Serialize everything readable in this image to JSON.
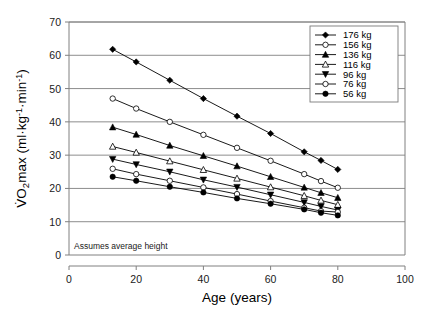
{
  "chart_data": {
    "type": "line",
    "title": "",
    "xlabel": "Age (years)",
    "ylabel": "VO2max (ml·kg⁻¹·min⁻¹)",
    "xlim": [
      0,
      100
    ],
    "ylim": [
      0,
      70
    ],
    "xticks": [
      0,
      20,
      40,
      60,
      80,
      100
    ],
    "yticks": [
      0,
      10,
      20,
      30,
      40,
      50,
      60,
      70
    ],
    "grid": "horizontal",
    "legend_position": "top-right",
    "annotation": "Assumes average height",
    "x": [
      13,
      20,
      30,
      40,
      50,
      60,
      70,
      75,
      80
    ],
    "series": [
      {
        "name": "176 kg",
        "marker": "filled-diamond",
        "values": [
          61.8,
          58.0,
          52.5,
          47.0,
          41.7,
          36.5,
          31.0,
          28.4,
          25.7
        ]
      },
      {
        "name": "156 kg",
        "marker": "open-circle",
        "values": [
          47.0,
          44.0,
          40.0,
          36.1,
          32.2,
          28.3,
          24.3,
          22.2,
          20.2
        ]
      },
      {
        "name": "136 kg",
        "marker": "filled-triangle",
        "values": [
          38.4,
          36.2,
          32.9,
          29.8,
          26.7,
          23.5,
          20.3,
          18.7,
          17.2
        ]
      },
      {
        "name": "116 kg",
        "marker": "open-triangle",
        "values": [
          32.6,
          30.8,
          28.2,
          25.6,
          23.0,
          20.4,
          17.8,
          16.4,
          15.1
        ]
      },
      {
        "name": "96 kg",
        "marker": "filled-down-triangle",
        "values": [
          28.8,
          27.2,
          25.0,
          22.6,
          20.4,
          18.1,
          15.8,
          14.6,
          13.5
        ]
      },
      {
        "name": "76 kg",
        "marker": "open-circle",
        "values": [
          25.9,
          24.3,
          22.3,
          20.3,
          18.3,
          16.2,
          14.2,
          13.2,
          12.9
        ]
      },
      {
        "name": "56 kg",
        "marker": "filled-circle",
        "values": [
          23.5,
          22.3,
          20.5,
          18.8,
          17.0,
          15.4,
          13.7,
          12.7,
          11.9
        ]
      }
    ]
  },
  "legend": {
    "items": [
      {
        "label": "176 kg"
      },
      {
        "label": "156 kg"
      },
      {
        "label": "136 kg"
      },
      {
        "label": "116 kg"
      },
      {
        "label": "96 kg"
      },
      {
        "label": "76 kg"
      },
      {
        "label": "56 kg"
      }
    ]
  },
  "axis": {
    "x_title": "Age (years)",
    "y_title_prefix": "V̇O",
    "y_title_sub": "2",
    "y_title_mid": "max (ml·kg",
    "y_title_sup1": "-1",
    "y_title_mid2": "·min",
    "y_title_sup2": "-1",
    "y_title_end": ")",
    "x_ticks": [
      "0",
      "20",
      "40",
      "60",
      "80",
      "100"
    ],
    "y_ticks": [
      "0",
      "10",
      "20",
      "30",
      "40",
      "50",
      "60",
      "70"
    ]
  },
  "annotation": {
    "text": "Assumes average height"
  },
  "colors": {
    "line": "#000000",
    "grid": "#808080",
    "axis": "#808080",
    "background": "#ffffff"
  }
}
